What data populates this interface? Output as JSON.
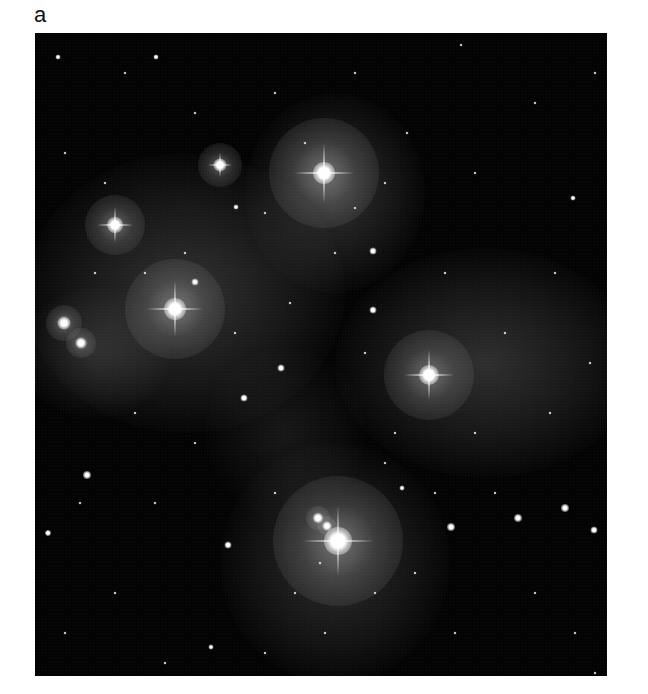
{
  "figure": {
    "panel_label": "a",
    "colors": {
      "background": "#ffffff",
      "sky": "#030303",
      "nebula": "#8a8a8a",
      "star": "#ffffff"
    }
  },
  "nebulae": [
    {
      "x": 150,
      "y": 260,
      "w": 320,
      "h": 280,
      "opacity": 0.32
    },
    {
      "x": 300,
      "y": 160,
      "w": 180,
      "h": 200,
      "opacity": 0.3
    },
    {
      "x": 450,
      "y": 330,
      "w": 300,
      "h": 230,
      "opacity": 0.3
    },
    {
      "x": 300,
      "y": 530,
      "w": 230,
      "h": 240,
      "opacity": 0.28
    },
    {
      "x": 60,
      "y": 320,
      "w": 150,
      "h": 130,
      "opacity": 0.22
    },
    {
      "x": 250,
      "y": 400,
      "w": 160,
      "h": 170,
      "opacity": 0.14
    }
  ],
  "bright_stars": [
    {
      "x": 289,
      "y": 140,
      "size": 22,
      "spike": 60,
      "halo": 110
    },
    {
      "x": 140,
      "y": 276,
      "size": 22,
      "spike": 56,
      "halo": 100
    },
    {
      "x": 303,
      "y": 508,
      "size": 28,
      "spike": 70,
      "halo": 130
    },
    {
      "x": 394,
      "y": 342,
      "size": 20,
      "spike": 50,
      "halo": 90
    },
    {
      "x": 80,
      "y": 192,
      "size": 16,
      "spike": 36,
      "halo": 60
    },
    {
      "x": 185,
      "y": 132,
      "size": 13,
      "spike": 24,
      "halo": 44
    },
    {
      "x": 29,
      "y": 290,
      "size": 13,
      "spike": 0,
      "halo": 36
    },
    {
      "x": 46,
      "y": 310,
      "size": 11,
      "spike": 0,
      "halo": 30
    },
    {
      "x": 283,
      "y": 485,
      "size": 10,
      "spike": 0,
      "halo": 24
    },
    {
      "x": 292,
      "y": 493,
      "size": 9,
      "spike": 0,
      "halo": 20
    }
  ],
  "medium_stars": [
    {
      "x": 160,
      "y": 249,
      "size": 7
    },
    {
      "x": 338,
      "y": 218,
      "size": 7
    },
    {
      "x": 338,
      "y": 277,
      "size": 7
    },
    {
      "x": 246,
      "y": 335,
      "size": 7
    },
    {
      "x": 209,
      "y": 365,
      "size": 7
    },
    {
      "x": 52,
      "y": 442,
      "size": 8
    },
    {
      "x": 193,
      "y": 512,
      "size": 7
    },
    {
      "x": 416,
      "y": 494,
      "size": 8
    },
    {
      "x": 483,
      "y": 485,
      "size": 8
    },
    {
      "x": 530,
      "y": 475,
      "size": 8
    },
    {
      "x": 559,
      "y": 497,
      "size": 7
    },
    {
      "x": 13,
      "y": 500,
      "size": 6
    },
    {
      "x": 121,
      "y": 24,
      "size": 5
    },
    {
      "x": 23,
      "y": 24,
      "size": 5
    },
    {
      "x": 367,
      "y": 455,
      "size": 5
    },
    {
      "x": 176,
      "y": 614,
      "size": 5
    },
    {
      "x": 201,
      "y": 174,
      "size": 5
    },
    {
      "x": 538,
      "y": 165,
      "size": 5
    }
  ],
  "faint_stars": [
    {
      "x": 90,
      "y": 40
    },
    {
      "x": 240,
      "y": 60
    },
    {
      "x": 320,
      "y": 40
    },
    {
      "x": 426,
      "y": 12
    },
    {
      "x": 500,
      "y": 70
    },
    {
      "x": 560,
      "y": 40
    },
    {
      "x": 30,
      "y": 120
    },
    {
      "x": 70,
      "y": 150
    },
    {
      "x": 230,
      "y": 180
    },
    {
      "x": 150,
      "y": 220
    },
    {
      "x": 300,
      "y": 220
    },
    {
      "x": 410,
      "y": 240
    },
    {
      "x": 520,
      "y": 240
    },
    {
      "x": 470,
      "y": 300
    },
    {
      "x": 555,
      "y": 330
    },
    {
      "x": 330,
      "y": 320
    },
    {
      "x": 100,
      "y": 380
    },
    {
      "x": 160,
      "y": 410
    },
    {
      "x": 360,
      "y": 400
    },
    {
      "x": 440,
      "y": 400
    },
    {
      "x": 515,
      "y": 380
    },
    {
      "x": 45,
      "y": 470
    },
    {
      "x": 120,
      "y": 470
    },
    {
      "x": 240,
      "y": 460
    },
    {
      "x": 350,
      "y": 430
    },
    {
      "x": 400,
      "y": 460
    },
    {
      "x": 460,
      "y": 460
    },
    {
      "x": 500,
      "y": 560
    },
    {
      "x": 540,
      "y": 600
    },
    {
      "x": 560,
      "y": 640
    },
    {
      "x": 80,
      "y": 560
    },
    {
      "x": 30,
      "y": 600
    },
    {
      "x": 130,
      "y": 630
    },
    {
      "x": 260,
      "y": 560
    },
    {
      "x": 285,
      "y": 530
    },
    {
      "x": 290,
      "y": 600
    },
    {
      "x": 340,
      "y": 560
    },
    {
      "x": 380,
      "y": 540
    },
    {
      "x": 420,
      "y": 600
    },
    {
      "x": 230,
      "y": 620
    },
    {
      "x": 200,
      "y": 300
    },
    {
      "x": 255,
      "y": 270
    },
    {
      "x": 110,
      "y": 240
    },
    {
      "x": 60,
      "y": 240
    },
    {
      "x": 350,
      "y": 150
    },
    {
      "x": 372,
      "y": 100
    },
    {
      "x": 440,
      "y": 140
    },
    {
      "x": 160,
      "y": 80
    },
    {
      "x": 270,
      "y": 110
    },
    {
      "x": 320,
      "y": 175
    }
  ]
}
